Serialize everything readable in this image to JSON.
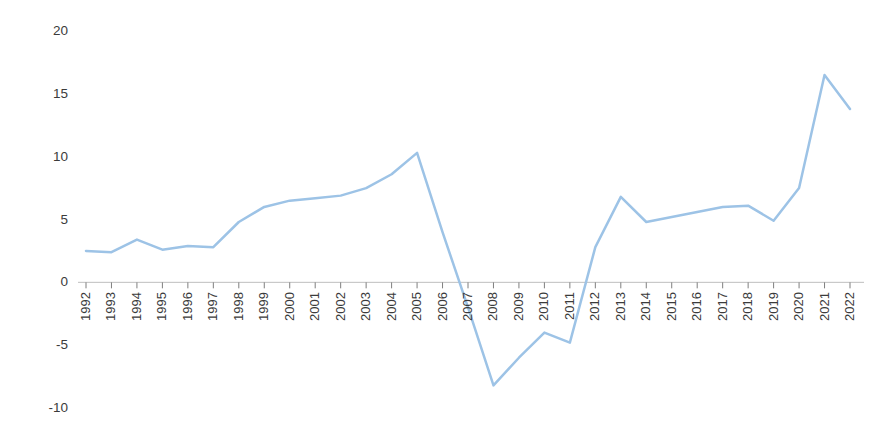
{
  "chart_data": {
    "type": "line",
    "title": "",
    "subtitle": "",
    "xlabel": "",
    "ylabel": "",
    "categories": [
      "1992",
      "1993",
      "1994",
      "1995",
      "1996",
      "1997",
      "1998",
      "1999",
      "2000",
      "2001",
      "2002",
      "2003",
      "2004",
      "2005",
      "2006",
      "2007",
      "2008",
      "2009",
      "2010",
      "2011",
      "2012",
      "2013",
      "2014",
      "2015",
      "2016",
      "2017",
      "2018",
      "2019",
      "2020",
      "2021",
      "2022"
    ],
    "values": [
      2.5,
      2.4,
      3.4,
      2.6,
      2.9,
      2.8,
      4.8,
      6.0,
      6.5,
      6.7,
      6.9,
      7.5,
      8.6,
      10.3,
      4.0,
      -2.0,
      -8.2,
      -6.0,
      -4.0,
      -4.8,
      2.8,
      6.8,
      4.8,
      5.2,
      5.6,
      6.0,
      6.1,
      4.9,
      7.5,
      16.5,
      13.8
    ],
    "series": [
      {
        "name": "Series 1",
        "color": "#9DC3E6",
        "values": [
          2.5,
          2.4,
          3.4,
          2.6,
          2.9,
          2.8,
          4.8,
          6.0,
          6.5,
          6.7,
          6.9,
          7.5,
          8.6,
          10.3,
          4.0,
          -2.0,
          -8.2,
          -6.0,
          -4.0,
          -4.8,
          2.8,
          6.8,
          4.8,
          5.2,
          5.6,
          6.0,
          6.1,
          4.9,
          7.5,
          16.5,
          13.8
        ]
      }
    ],
    "y_ticks": [
      20,
      15,
      10,
      5,
      0,
      -5,
      -10
    ],
    "y_tick_labels": [
      "20",
      "15",
      "10",
      "5",
      "0",
      "-5",
      "-10"
    ],
    "ylim": [
      -10,
      20
    ],
    "grid": false,
    "legend": false,
    "legend_position": "none",
    "axis_line_color": "#BFBFBF",
    "tick_color": "#7F7F7F",
    "background": "#FFFFFF",
    "line_width": 2.5,
    "x_axis_at_value": 0
  }
}
